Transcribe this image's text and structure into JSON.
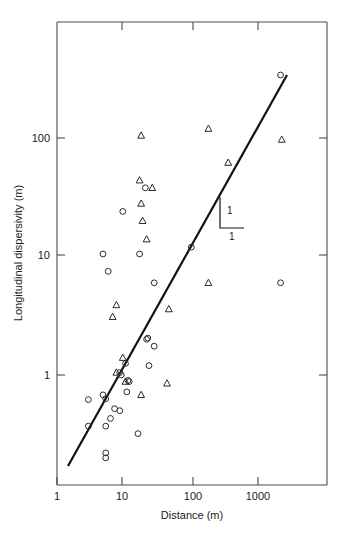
{
  "figure": {
    "background_color": "#ffffff",
    "axis_color": "#4a4a4a",
    "marker_color": "#2b2b2b",
    "line_color": "#111111"
  },
  "axes": {
    "x_title": "Distance (m)",
    "y_title": "Longitudinal dispersivity (m)",
    "x_ticks": [
      "1",
      "10",
      "100",
      "1000"
    ],
    "y_ticks": [
      "1",
      "10",
      "100"
    ]
  },
  "annotations": {
    "slope_rise_label": "1",
    "slope_run_label": "1"
  },
  "caption": {
    "text": ""
  },
  "chart_data": {
    "type": "scatter",
    "title": "",
    "xlabel": "Distance (m)",
    "ylabel": "Longitudinal dispersivity (m)",
    "xscale": "log",
    "yscale": "log",
    "xlim": [
      1,
      6000
    ],
    "ylim": [
      0.15,
      800
    ],
    "xticks": [
      1,
      10,
      100,
      1000
    ],
    "yticks": [
      1,
      10,
      100
    ],
    "grid": false,
    "legend": null,
    "series": [
      {
        "name": "circles",
        "marker": "circle",
        "points": [
          [
            2500,
            340
          ],
          [
            22,
            38
          ],
          [
            10,
            24
          ],
          [
            5,
            10.5
          ],
          [
            18,
            10.5
          ],
          [
            110,
            12
          ],
          [
            2500,
            6.0
          ],
          [
            30,
            6.0
          ],
          [
            6,
            7.5
          ],
          [
            23,
            2.0
          ],
          [
            24,
            2.05
          ],
          [
            30,
            1.75
          ],
          [
            11,
            1.25
          ],
          [
            25,
            1.2
          ],
          [
            9,
            1.05
          ],
          [
            9.5,
            1.0
          ],
          [
            12,
            0.9
          ],
          [
            12.5,
            0.88
          ],
          [
            11.5,
            0.72
          ],
          [
            5,
            0.68
          ],
          [
            5.5,
            0.63
          ],
          [
            3,
            0.62
          ],
          [
            7.5,
            0.52
          ],
          [
            9,
            0.5
          ],
          [
            6.5,
            0.43
          ],
          [
            5.5,
            0.37
          ],
          [
            3,
            0.37
          ],
          [
            17,
            0.32
          ],
          [
            5.5,
            0.22
          ],
          [
            5.5,
            0.2
          ]
        ]
      },
      {
        "name": "triangles",
        "marker": "triangle",
        "points": [
          [
            200,
            120
          ],
          [
            19,
            105
          ],
          [
            2600,
            97
          ],
          [
            400,
            62
          ],
          [
            18,
            44
          ],
          [
            28,
            38
          ],
          [
            19,
            28
          ],
          [
            20,
            20
          ],
          [
            23,
            14
          ],
          [
            200,
            6.0
          ],
          [
            50,
            3.6
          ],
          [
            8,
            3.9
          ],
          [
            7,
            3.1
          ],
          [
            10,
            1.4
          ],
          [
            8,
            1.05
          ],
          [
            11,
            0.88
          ],
          [
            47,
            0.85
          ],
          [
            19,
            0.68
          ]
        ]
      }
    ],
    "reference_line": {
      "slope": 1,
      "description": "1:1 reference line on log-log axes",
      "x_start": 2.1,
      "y_start": 0.195,
      "x_end": 2050,
      "y_end": 268
    },
    "slope_triangle": {
      "rise_label": "1",
      "run_label": "1"
    }
  }
}
